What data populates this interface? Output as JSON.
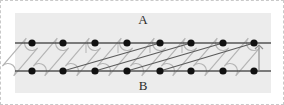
{
  "figure": {
    "type": "braid-permutation-diagram",
    "canvas": {
      "width": 284,
      "height": 105
    },
    "plot_area": {
      "x": 14,
      "y": 12,
      "width": 256,
      "height": 80,
      "fill": "#ececec"
    },
    "border": {
      "style": "dashed",
      "color": "#c9c9c9"
    },
    "labels": {
      "top": "A",
      "bottom": "B"
    },
    "label_positions": {
      "top": {
        "x": 142,
        "y": 20
      },
      "bottom": {
        "x": 142,
        "y": 86
      }
    },
    "colors": {
      "background": "#ececec",
      "page": "#ffffff",
      "rail": "#555555",
      "node": "#111111",
      "loop": "#b5b5b5",
      "diagonal": "#5a5a5a",
      "arrow": "#8f8f8f",
      "label": "#2b2b2b",
      "border": "#c9c9c9"
    },
    "rails": {
      "top_y": 42,
      "bottom_y": 70,
      "x_start": 14,
      "x_end": 270,
      "stroke_width": 1.6
    },
    "nodes": {
      "count_per_rail": 8,
      "radius": 3.6,
      "x_positions": [
        31,
        62,
        94,
        126,
        159,
        190,
        222,
        253
      ],
      "top_y": 42,
      "bottom_y": 70
    },
    "loops": {
      "description": "stadium-shaped tilted capsules linking each top node to the bottom node to its left",
      "stroke_width": 1.2,
      "cap_radius": 7.5,
      "count": 8,
      "pairs": [
        {
          "top_index": 0,
          "bottom_index": 0
        },
        {
          "top_index": 1,
          "bottom_index": 1
        },
        {
          "top_index": 2,
          "bottom_index": 2
        },
        {
          "top_index": 3,
          "bottom_index": 3
        },
        {
          "top_index": 4,
          "bottom_index": 4
        },
        {
          "top_index": 5,
          "bottom_index": 5
        },
        {
          "top_index": 6,
          "bottom_index": 6
        },
        {
          "top_index": 7,
          "bottom_index": 7
        }
      ],
      "tilt_dx": -24
    },
    "diagonals": [
      {
        "from_node": 1,
        "to_node": 4,
        "from_rail": "bottom",
        "to_rail": "top",
        "stroke_width": 1.1
      },
      {
        "from_node": 2,
        "to_node": 5,
        "from_rail": "bottom",
        "to_rail": "top",
        "stroke_width": 1.1
      },
      {
        "from_node": 4,
        "to_node": 7,
        "from_rail": "bottom",
        "to_rail": "top",
        "stroke_width": 1.1
      },
      {
        "from_node": 3,
        "to_node": 6,
        "from_rail": "bottom",
        "to_rail": "top",
        "stroke_width": 1.1
      }
    ],
    "arrow": {
      "name": "up-arrow",
      "x": 258,
      "y_from": 70,
      "y_to": 44,
      "head_size": 4,
      "stroke_width": 1.2
    },
    "tick_marks": [
      {
        "x": 85,
        "y_from": 42,
        "y_to": 52
      },
      {
        "x": 117,
        "y_from": 42,
        "y_to": 52
      },
      {
        "x": 149,
        "y_from": 42,
        "y_to": 52
      },
      {
        "x": 181,
        "y_from": 42,
        "y_to": 52
      }
    ]
  }
}
